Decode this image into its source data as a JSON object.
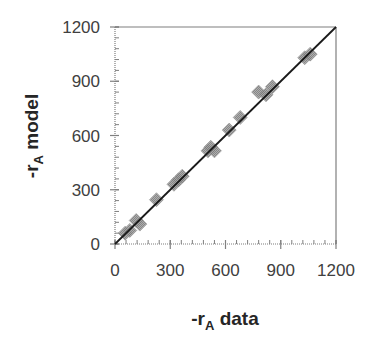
{
  "chart_data": {
    "type": "scatter",
    "title": "",
    "xlabel": "-r_A data",
    "ylabel": "-r_A model",
    "xlabel_parts": {
      "prefix": "-r",
      "subscript": "A",
      "suffix": " data"
    },
    "ylabel_parts": {
      "prefix": "-r",
      "subscript": "A",
      "suffix": " model"
    },
    "xlim": [
      0,
      1200
    ],
    "ylim": [
      0,
      1200
    ],
    "x_ticks": [
      0,
      300,
      600,
      900,
      1200
    ],
    "y_ticks": [
      0,
      300,
      600,
      900,
      1200
    ],
    "x_tick_labels": [
      "0",
      "300",
      "600",
      "900",
      "1200"
    ],
    "y_tick_labels": [
      "0",
      "300",
      "600",
      "900",
      "1200"
    ],
    "minor_tick_step": 60,
    "grid": false,
    "legend": null,
    "reference_line": {
      "type": "parity",
      "from": [
        0,
        0
      ],
      "to": [
        1200,
        1200
      ],
      "color": "#1a1a1a"
    },
    "marker": {
      "shape": "hatched-diamond",
      "color": "#8c8c8c"
    },
    "series": [
      {
        "name": "data vs model",
        "points": [
          {
            "x": 55,
            "y": 60
          },
          {
            "x": 80,
            "y": 75
          },
          {
            "x": 115,
            "y": 130
          },
          {
            "x": 135,
            "y": 110
          },
          {
            "x": 225,
            "y": 245
          },
          {
            "x": 320,
            "y": 330
          },
          {
            "x": 345,
            "y": 355
          },
          {
            "x": 365,
            "y": 375
          },
          {
            "x": 505,
            "y": 515
          },
          {
            "x": 520,
            "y": 535
          },
          {
            "x": 540,
            "y": 515
          },
          {
            "x": 620,
            "y": 630
          },
          {
            "x": 680,
            "y": 700
          },
          {
            "x": 780,
            "y": 840
          },
          {
            "x": 820,
            "y": 825
          },
          {
            "x": 855,
            "y": 870
          },
          {
            "x": 1030,
            "y": 1030
          },
          {
            "x": 1060,
            "y": 1050
          }
        ]
      }
    ]
  }
}
